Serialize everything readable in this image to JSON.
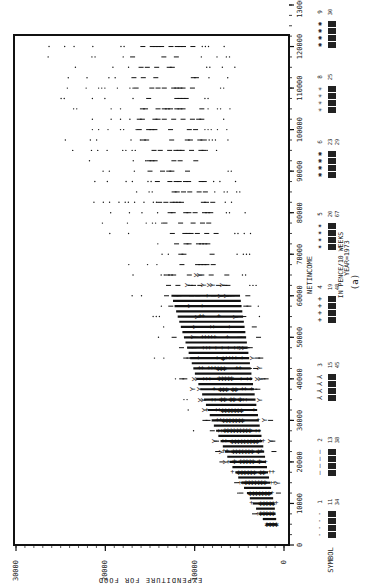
{
  "chart_data": {
    "type": "scatter",
    "orientation": "rotated-90-clockwise",
    "title": "",
    "xlabel": "NETINCOME",
    "xlabel_sub": "IN PENCE/10 WEEKS",
    "xlabel_sub2": "YEAR=1973",
    "ylabel": "EXPENDITURE FOR FOOD",
    "panel_label": "(a)",
    "xlim": [
      0,
      130000
    ],
    "ylim": [
      0,
      30000
    ],
    "x_ticks": [
      0,
      10000,
      20000,
      30000,
      40000,
      50000,
      60000,
      70000,
      80000,
      90000,
      100000,
      110000,
      120000,
      130000
    ],
    "x_tick_labels": [
      "0",
      "10000",
      "20000",
      "30000",
      "40000",
      "50000",
      "60000",
      "70000",
      "80000",
      "90000",
      "100000",
      "110000",
      "120000",
      "130000"
    ],
    "y_ticks": [
      0,
      10000,
      20000,
      30000
    ],
    "y_tick_labels": [
      "0",
      "10000",
      "20000",
      "30000"
    ],
    "grid": false,
    "legend_position": "right (below x-axis in rotated view)",
    "legend_title": "SYMBOL",
    "legend": [
      {
        "symbol": "1",
        "glyph": "·",
        "freq_range": "11-34"
      },
      {
        "symbol": "2",
        "glyph": "—",
        "freq_range": "13-38"
      },
      {
        "symbol": "3",
        "glyph": "⅄",
        "freq_range": "15-45"
      },
      {
        "symbol": "4",
        "glyph": "+",
        "freq_range": "19-48"
      },
      {
        "symbol": "5",
        "glyph": "✶",
        "freq_range": "20-67"
      },
      {
        "symbol": "6",
        "glyph": "✱",
        "freq_range": "23-29"
      },
      {
        "symbol": "8",
        "glyph": "✳",
        "freq_range": "25-"
      },
      {
        "symbol": "9",
        "glyph": "✺",
        "freq_range": "30-"
      }
    ],
    "density_profile": {
      "description": "Dense fan-shaped cloud: food expenditure rises with net income; spread widens with income; densest at low-mid income.",
      "bands": [
        {
          "netincome": 5000,
          "food_min": 500,
          "food_max": 3000
        },
        {
          "netincome": 10000,
          "food_min": 500,
          "food_max": 5500
        },
        {
          "netincome": 20000,
          "food_min": 1000,
          "food_max": 9500
        },
        {
          "netincome": 30000,
          "food_min": 1500,
          "food_max": 12500
        },
        {
          "netincome": 40000,
          "food_min": 2000,
          "food_max": 15000
        },
        {
          "netincome": 50000,
          "food_min": 2500,
          "food_max": 17000
        },
        {
          "netincome": 60000,
          "food_min": 3000,
          "food_max": 19000
        },
        {
          "netincome": 70000,
          "food_min": 3500,
          "food_max": 21000
        },
        {
          "netincome": 80000,
          "food_min": 4000,
          "food_max": 23000
        },
        {
          "netincome": 90000,
          "food_min": 4500,
          "food_max": 25000
        },
        {
          "netincome": 100000,
          "food_min": 5000,
          "food_max": 27000
        },
        {
          "netincome": 110000,
          "food_min": 5000,
          "food_max": 28000
        },
        {
          "netincome": 120000,
          "food_min": 6000,
          "food_max": 28000
        }
      ]
    }
  }
}
